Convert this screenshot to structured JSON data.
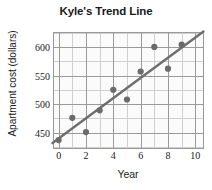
{
  "chart_data": {
    "type": "scatter",
    "title": "Kyle's Trend Line",
    "xlabel": "Year",
    "ylabel": "Apartment cost (dollars)",
    "x": [
      0,
      1,
      2,
      3,
      4,
      5,
      6,
      7,
      8,
      9
    ],
    "values": [
      437,
      476,
      451,
      489,
      525,
      508,
      557,
      600,
      562,
      604
    ],
    "points": [
      {
        "x": 0,
        "y": 437
      },
      {
        "x": 1,
        "y": 476
      },
      {
        "x": 2,
        "y": 451
      },
      {
        "x": 3,
        "y": 489
      },
      {
        "x": 4,
        "y": 525
      },
      {
        "x": 5,
        "y": 508
      },
      {
        "x": 6,
        "y": 557
      },
      {
        "x": 7,
        "y": 600
      },
      {
        "x": 8,
        "y": 562
      },
      {
        "x": 9,
        "y": 604
      }
    ],
    "xlim": [
      -0.45,
      10.6
    ],
    "ylim": [
      424,
      627
    ],
    "xticks": [
      0,
      2,
      4,
      6,
      8,
      10
    ],
    "xtick_labels": [
      "0",
      "2",
      "4",
      "6",
      "8",
      "10"
    ],
    "yticks": [
      450,
      500,
      550,
      600
    ],
    "ytick_labels": [
      "450",
      "500",
      "550",
      "600"
    ],
    "grid": true,
    "grid_minor": true,
    "grid_major_step_x": 2,
    "grid_minor_step_x": 1,
    "grid_major_step_y": 50,
    "grid_minor_step_y": 25,
    "legend": null,
    "trend_line": {
      "label": "Trend Line",
      "x_start": -0.45,
      "y_start": 432,
      "x_end": 10.6,
      "y_end": 627,
      "slope": 17.6,
      "intercept": 440
    },
    "colors": {
      "marker": "#6b6b6b",
      "trend_line": "#6e6e6e",
      "grid_major": "#9a9a9a",
      "grid_minor": "#d0d0d0",
      "plot_background": "#fbfbfb",
      "text": "#1a1a1a"
    }
  }
}
